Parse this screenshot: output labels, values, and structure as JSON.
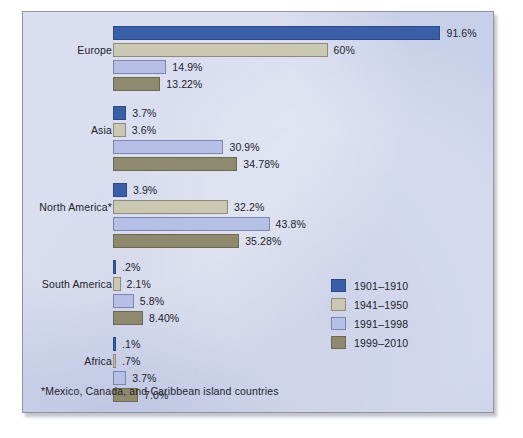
{
  "chart_data": {
    "type": "bar",
    "orientation": "horizontal",
    "title": "",
    "xlabel": "",
    "ylabel": "",
    "grid": false,
    "xlim": [
      0,
      100
    ],
    "xunit": "%",
    "legend_position": "middle-right",
    "categories": [
      "Europe",
      "Asia",
      "North America*",
      "South America",
      "Africa"
    ],
    "series": [
      {
        "name": "1901–1910",
        "color": "#3a5fa8",
        "values": [
          91.6,
          3.7,
          3.9,
          0.2,
          0.1
        ],
        "labels": [
          "91.6%",
          "3.7%",
          "3.9%",
          ".2%",
          ".1%"
        ]
      },
      {
        "name": "1941–1950",
        "color": "#cac7b2",
        "values": [
          60,
          3.6,
          32.2,
          2.1,
          0.7
        ],
        "labels": [
          "60%",
          "3.6%",
          "32.2%",
          "2.1%",
          ".7%"
        ]
      },
      {
        "name": "1991–1998",
        "color": "#b6bfe6",
        "values": [
          14.9,
          30.9,
          43.8,
          5.8,
          3.7
        ],
        "labels": [
          "14.9%",
          "30.9%",
          "43.8%",
          "5.8%",
          "3.7%"
        ]
      },
      {
        "name": "1999–2010",
        "color": "#8f8a6f",
        "values": [
          13.22,
          34.78,
          35.28,
          8.4,
          7.0
        ],
        "labels": [
          "13.22%",
          "34.78%",
          "35.28%",
          "8.40%",
          "7.0%"
        ]
      }
    ],
    "footnote": "*Mexico, Canada, and Caribbean island countries",
    "background_color": "#c8cfe9",
    "border_color": "#8f93a6"
  },
  "legend": {
    "items": [
      {
        "label": "1901–1910",
        "color": "#3a5fa8"
      },
      {
        "label": "1941–1950",
        "color": "#cac7b2"
      },
      {
        "label": "1991–1998",
        "color": "#b6bfe6"
      },
      {
        "label": "1999–2010",
        "color": "#8f8a6f"
      }
    ]
  },
  "footnote": {
    "text": "*Mexico, Canada, and Caribbean island countries"
  }
}
